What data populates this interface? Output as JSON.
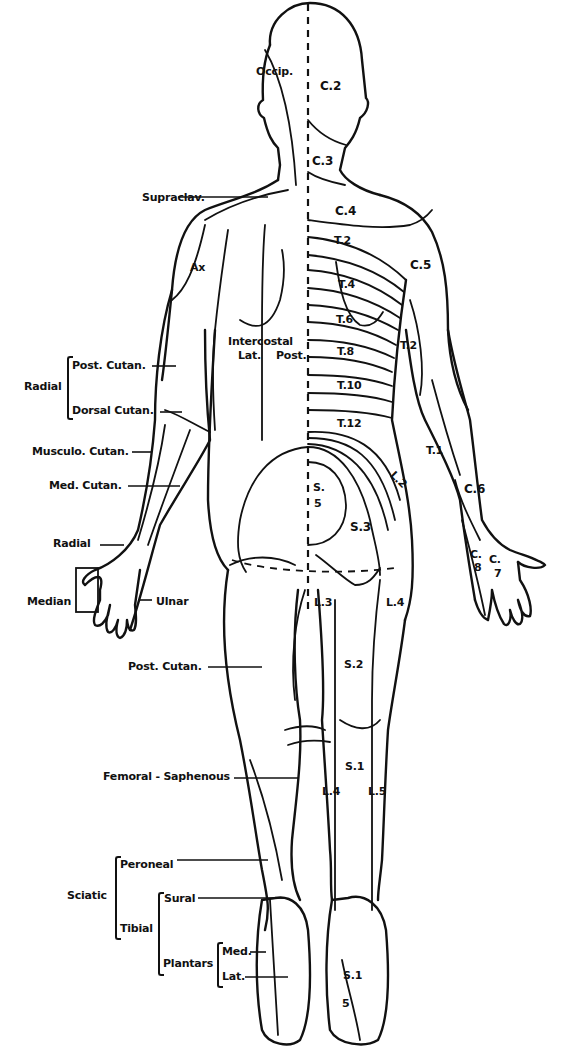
{
  "figure": {
    "colors": {
      "ink": "#111111",
      "background": "#ffffff"
    }
  },
  "dermatome_labels": {
    "occip": "Occip.",
    "c2": "C.2",
    "c3": "C.3",
    "c4": "C.4",
    "c5": "C.5",
    "c6": "C.6",
    "c7_top": "C.",
    "c7_bot": "7",
    "c8_top": "C.",
    "c8_bot": "8",
    "t1": "T.1",
    "t2_back": "T.2",
    "t2_arm": "T.2",
    "t4": "T.4",
    "t6": "T.6",
    "t8": "T.8",
    "t10": "T.10",
    "t12": "T.12",
    "l2": "L.2",
    "l3": "L.3",
    "l4_thigh": "L.4",
    "l4_leg": "L.4",
    "l5": "L.5",
    "s1_leg": "S.1",
    "s1_foot": "S.1",
    "s5_foot": "5",
    "s2": "S.2",
    "s3": "S.3",
    "s45_top": "S.",
    "s45_bot": "5",
    "ax": "Ax",
    "intercostal": "Intercostal",
    "lat": "Lat.",
    "post": "Post."
  },
  "nerve_labels": {
    "supraclav": "Supraclav.",
    "radial_group": "Radial",
    "post_cutan_arm": "Post. Cutan.",
    "dorsal_cutan": "Dorsal Cutan.",
    "musculo_cutan": "Musculo. Cutan.",
    "med_cutan": "Med. Cutan.",
    "radial_hand": "Radial",
    "median": "Median",
    "ulnar": "Ulnar",
    "post_cutan_thigh": "Post. Cutan.",
    "femoral_saphenous": "Femoral - Saphenous",
    "sciatic": "Sciatic",
    "peroneal": "Peroneal",
    "tibial": "Tibial",
    "sural": "Sural",
    "plantars": "Plantars",
    "plantar_med": "Med.",
    "plantar_lat": "Lat."
  }
}
